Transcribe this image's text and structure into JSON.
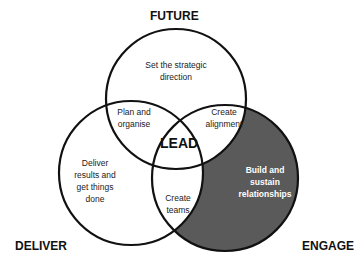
{
  "titles": {
    "future": "FUTURE",
    "deliver": "DELIVER",
    "engage": "ENGAGE",
    "center": "LEAD"
  },
  "regions": {
    "future_only": [
      "Set the strategic",
      "direction"
    ],
    "future_deliver": [
      "Plan and",
      "organise"
    ],
    "future_engage": [
      "Create",
      "alignment"
    ],
    "deliver_only": [
      "Deliver",
      "results and",
      "get things",
      "done"
    ],
    "deliver_engage": [
      "Create",
      "teams"
    ],
    "engage_only": [
      "Build and",
      "sustain",
      "relationships"
    ]
  },
  "colors": {
    "outline": "#111111",
    "highlight_fill": "#5a5a5a",
    "background": "#ffffff"
  }
}
